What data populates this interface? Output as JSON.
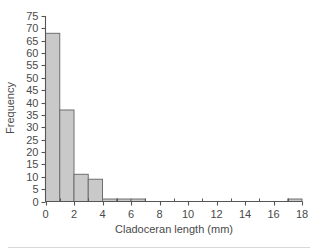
{
  "chart_data": {
    "type": "bar",
    "title": "",
    "subtitle": "",
    "xlabel": "Cladoceran length (mm)",
    "ylabel": "Frequency",
    "xlim": [
      0,
      18
    ],
    "ylim": [
      0,
      75
    ],
    "xtick_step": 2,
    "ytick_step": 5,
    "x_minor_tick_step": 1,
    "grid": false,
    "legend": false,
    "legend_position": "none",
    "bin_width": 1,
    "bar_fill_color": "#c9c9c9",
    "bar_edge_color": "#6e6e6e",
    "axis_color": "#555555",
    "categories": [
      "0-1",
      "1-2",
      "2-3",
      "3-4",
      "4-5",
      "5-6",
      "6-7",
      "7-8",
      "8-9",
      "9-10",
      "10-11",
      "11-12",
      "12-13",
      "13-14",
      "14-15",
      "15-16",
      "16-17",
      "17-18"
    ],
    "bin_starts": [
      0,
      1,
      2,
      3,
      4,
      5,
      6,
      7,
      8,
      9,
      10,
      11,
      12,
      13,
      14,
      15,
      16,
      17
    ],
    "values": [
      68,
      37,
      11,
      9,
      1,
      1,
      1,
      0,
      0,
      0,
      0,
      0,
      0,
      0,
      0,
      0,
      0,
      1
    ],
    "xticks": [
      0,
      2,
      4,
      6,
      8,
      10,
      12,
      14,
      16,
      18
    ],
    "xticklabels": [
      "0",
      "2",
      "4",
      "6",
      "8",
      "10",
      "12",
      "14",
      "16",
      "18"
    ],
    "yticks": [
      0,
      5,
      10,
      15,
      20,
      25,
      30,
      35,
      40,
      45,
      50,
      55,
      60,
      65,
      70,
      75
    ],
    "yticklabels": [
      "0",
      "5",
      "10",
      "15",
      "20",
      "25",
      "30",
      "35",
      "40",
      "45",
      "50",
      "55",
      "60",
      "65",
      "70",
      "75"
    ]
  }
}
